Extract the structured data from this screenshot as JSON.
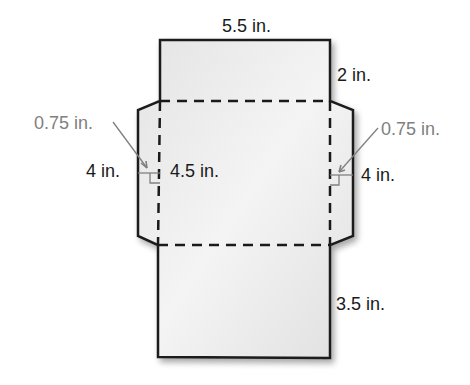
{
  "diagram": {
    "type": "envelope-net",
    "colors": {
      "fill": "#ececec",
      "outline": "#1a1a1a",
      "annotation": "#808080"
    },
    "labels": {
      "top_width": "5.5 in.",
      "top_flap_height": "2 in.",
      "left_flap_depth": "0.75 in.",
      "right_flap_depth": "0.75 in.",
      "left_flap_length": "4 in.",
      "center_height": "4.5 in.",
      "right_flap_length": "4 in.",
      "bottom_flap_height": "3.5 in."
    }
  }
}
